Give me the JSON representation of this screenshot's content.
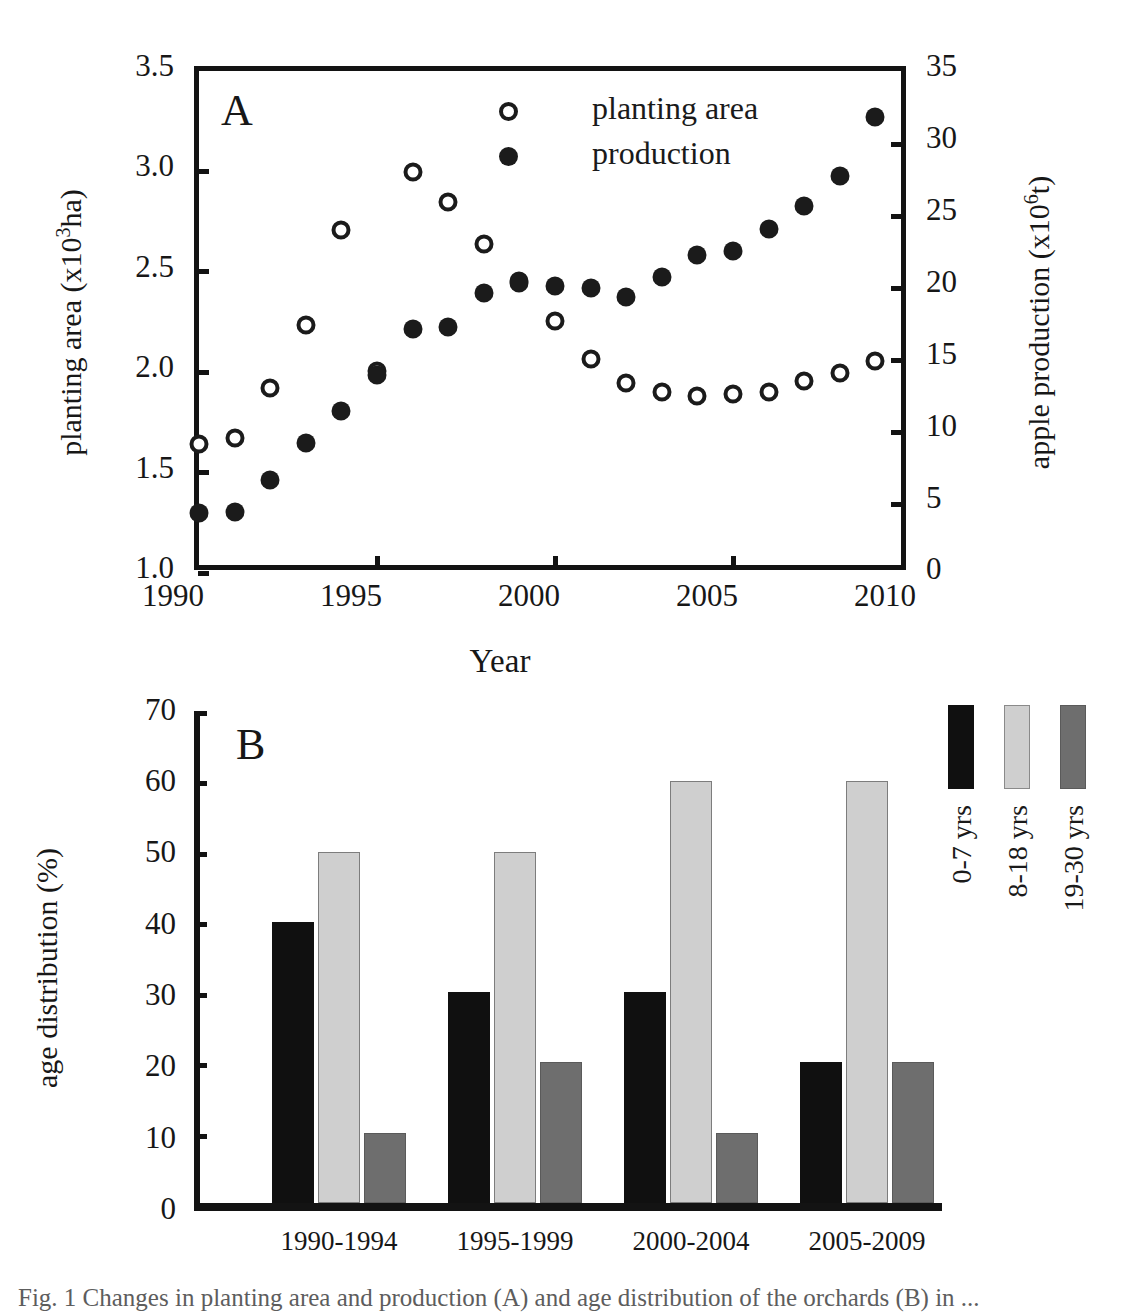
{
  "figure": {
    "panel_a_letter": "A",
    "panel_b_letter": "B",
    "caption": "Fig. 1  Changes in planting area and production (A) and age distribution of the orchards (B) in ..."
  },
  "panelA": {
    "ylabel_left": "planting area (x103ha)",
    "ylabel_right": "apple production (x106t)",
    "xlabel": "Year",
    "yticks_left": [
      "3.5",
      "3.0",
      "2.5",
      "2.0",
      "1.5",
      "1.0"
    ],
    "yticks_right": [
      "35",
      "30",
      "25",
      "20",
      "15",
      "10",
      "5",
      "0"
    ],
    "xticks": [
      "1990",
      "1995",
      "2000",
      "2005",
      "2010"
    ],
    "legend": [
      {
        "marker": "open-circle",
        "label": "planting area"
      },
      {
        "marker": "filled-circle",
        "label": "production"
      }
    ]
  },
  "panelB": {
    "ylabel": "age distribution (%)",
    "yticks": [
      "70",
      "60",
      "50",
      "40",
      "30",
      "20",
      "10",
      "0"
    ],
    "legend": [
      {
        "label": "0-7 yrs",
        "color": "#101010"
      },
      {
        "label": "8-18 yrs",
        "color": "#cfcfcf"
      },
      {
        "label": "19-30 yrs",
        "color": "#6e6e6e"
      }
    ]
  },
  "chart_data": [
    {
      "type": "scatter",
      "panel": "A",
      "title": "",
      "xlabel": "Year",
      "ylabel": "planting area (x10³ha)",
      "ylabel_right": "apple production (x10⁶t)",
      "xlim": [
        1990,
        2010
      ],
      "ylim": [
        1.0,
        3.5
      ],
      "ylim_right": [
        0,
        35
      ],
      "grid": false,
      "legend_position": "top-center",
      "x": [
        1990,
        1991,
        1992,
        1993,
        1994,
        1995,
        1996,
        1997,
        1998,
        1999,
        2000,
        2001,
        2002,
        2003,
        2004,
        2005,
        2006,
        2007,
        2008,
        2009
      ],
      "series": [
        {
          "name": "planting area",
          "marker": "open-circle",
          "axis": "left",
          "units": "x10³ ha",
          "values": [
            1.65,
            1.68,
            1.93,
            2.24,
            2.71,
            2.01,
            3.0,
            2.85,
            2.64,
            2.46,
            2.26,
            2.07,
            1.95,
            1.91,
            1.89,
            1.9,
            1.91,
            1.96,
            2.0,
            2.06
          ]
        },
        {
          "name": "production",
          "marker": "filled-circle",
          "axis": "right",
          "units": "x10⁶ t",
          "values": [
            4.3,
            4.4,
            6.6,
            9.2,
            11.4,
            13.9,
            17.1,
            17.2,
            19.6,
            20.3,
            20.1,
            19.9,
            19.3,
            20.7,
            22.2,
            22.5,
            24.0,
            25.6,
            27.7,
            31.8
          ]
        }
      ]
    },
    {
      "type": "bar",
      "panel": "B",
      "title": "",
      "xlabel": "",
      "ylabel": "age distribution (%)",
      "ylim": [
        0,
        70
      ],
      "grid": false,
      "legend_position": "right",
      "categories": [
        "1990-1994",
        "1995-1999",
        "2000-2004",
        "2005-2009"
      ],
      "series": [
        {
          "name": "0-7 yrs",
          "color": "#101010",
          "values": [
            40,
            30,
            30,
            20
          ]
        },
        {
          "name": "8-18 yrs",
          "color": "#cfcfcf",
          "values": [
            50,
            50,
            60,
            60
          ]
        },
        {
          "name": "19-30 yrs",
          "color": "#6e6e6e",
          "values": [
            10,
            20,
            10,
            20
          ]
        }
      ]
    }
  ]
}
